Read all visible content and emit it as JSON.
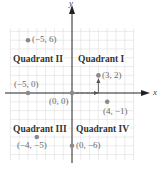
{
  "diagram": {
    "type": "coordinate-plane",
    "axes": {
      "x_label": "x",
      "y_label": "y"
    },
    "origin_px": [
      72,
      93
    ],
    "unit_px": 8.8,
    "grid": {
      "x_min": -7,
      "x_max": 7,
      "y_min": -7,
      "y_max": 7
    },
    "quadrants": [
      {
        "name": "Quadrant I",
        "label": "Quadrant I"
      },
      {
        "name": "Quadrant II",
        "label": "Quadrant II"
      },
      {
        "name": "Quadrant III",
        "label": "Quadrant III"
      },
      {
        "name": "Quadrant IV",
        "label": "Quadrant IV"
      }
    ],
    "points": [
      {
        "x": -5,
        "y": 6,
        "label": "(−5, 6)"
      },
      {
        "x": -5,
        "y": 0,
        "label": "(−5, 0)"
      },
      {
        "x": 0,
        "y": 0,
        "label": "(0, 0)"
      },
      {
        "x": 3,
        "y": 2,
        "label": "(3, 2)"
      },
      {
        "x": 4,
        "y": -1,
        "label": "(4, −1)"
      },
      {
        "x": -4,
        "y": -5,
        "label": "(−4, −5)"
      },
      {
        "x": 0,
        "y": -6,
        "label": "(0, −6)"
      }
    ],
    "path_arrows": "dashed arrow from (0,0) right 3 units, then solid arrow up 2 units to (3,2)",
    "colors": {
      "grid": "#dcdcdc",
      "axis": "#222222",
      "point": "#8a8a8a",
      "label": "#6b6b6b"
    }
  }
}
